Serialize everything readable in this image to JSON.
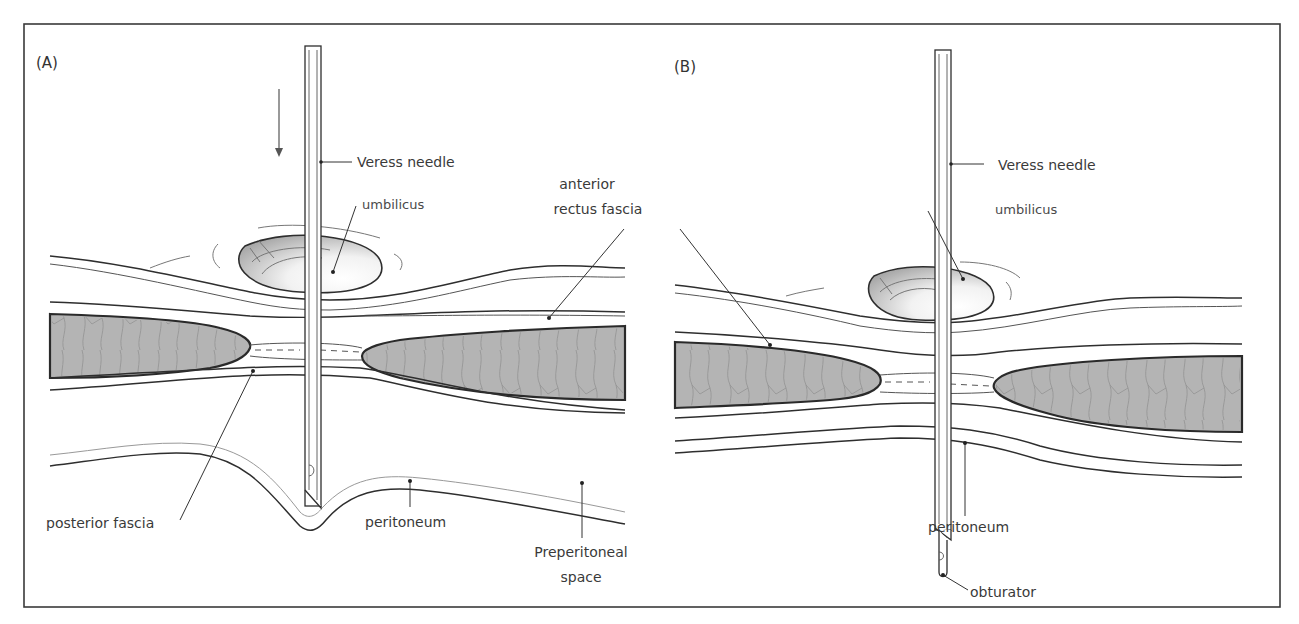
{
  "figure": {
    "panels": [
      {
        "id": "A",
        "tag": "(A)",
        "labels": {
          "veress_needle": "Veress needle",
          "umbilicus": "umbilicus",
          "anterior_rectus_fascia_line1": "anterior",
          "anterior_rectus_fascia_line2": "rectus fascia",
          "posterior_fascia": "posterior fascia",
          "peritoneum": "peritoneum",
          "preperitoneal_line1": "Preperitoneal",
          "preperitoneal_line2": "space"
        },
        "arrow": "down-arrow"
      },
      {
        "id": "B",
        "tag": "(B)",
        "labels": {
          "veress_needle": "Veress needle",
          "umbilicus": "umbilicus",
          "peritoneum": "peritoneum",
          "obturator": "obturator"
        }
      }
    ],
    "colors": {
      "muscle_fill": "#b4b4b4",
      "line": "#2e2e2e",
      "frame": "#3a3a3a",
      "text": "#3a3a3a"
    }
  }
}
